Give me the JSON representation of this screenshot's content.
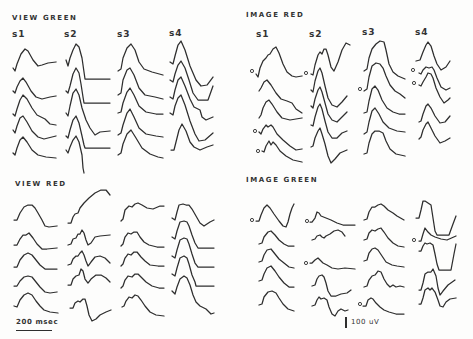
{
  "figure": {
    "panels": [
      {
        "id": "view-green",
        "title": "VIEW GREEN",
        "columns": [
          "s1",
          "s2",
          "s3",
          "s4"
        ]
      },
      {
        "id": "image-red",
        "title": "IMAGE RED",
        "columns": [
          "s1",
          "s2",
          "s3",
          "s4"
        ]
      },
      {
        "id": "view-red",
        "title": "VIEW RED",
        "columns": []
      },
      {
        "id": "image-green",
        "title": "IMAGE GREEN",
        "columns": []
      }
    ],
    "scale_bars": {
      "time": "200 msec",
      "voltage": "100 uV"
    },
    "trace_color": "#2e2e2e",
    "background_color": "#fdfdfc"
  },
  "traces": {
    "view_green": [
      "M13,68 L15,71 L17,64 L21,54 L25,49 L28,51 L33,60 L38,66 L42,65 L48,63 L56,62",
      "M13,91 L15,93 L17,87 L20,81 L23,78 L26,82 L31,91 L36,97 L42,99 L50,97 L56,96",
      "M13,114 L15,116 L17,109 L20,100 L23,95 L27,99 L32,108 L37,115 L41,117 L45,119 L50,124 L56,125",
      "M13,130 L15,133 L17,126 L20,118 L23,116 L27,122 L32,131 L38,137 L44,139 L52,137 L56,136",
      "M13,153 L15,155 L17,148 L20,140 L23,137 L27,142 L32,150 L38,155 L46,157 L56,158",
      "M66,60 L68,66 L70,58 L73,50 L76,44 L79,47 L82,58 L84,72 L85,79 L110,79",
      "M66,91 L68,93 L70,86 L73,74 L76,68 L79,73 L81,84 L83,97 L84,103 L110,103",
      "M66,113 L68,116 L70,106 L73,93 L76,89 L79,95 L82,108 L86,120 L90,128 L95,135 L100,132 L110,131",
      "M66,136 L68,138 L70,130 L73,120 L76,116 L79,123 L82,136 L84,145 L85,148 L110,148",
      "M66,150 L68,153 L70,147 L73,140 L76,136 L79,142 L82,155 L83,168 L84,173",
      "M118,71 L121,69 L123,58 L127,48 L131,44 L135,50 L139,62 L144,69 L152,72 L163,75",
      "M118,95 L121,93 L123,80 L127,70 L130,68 L134,75 L139,88 L145,95 L155,97 L163,99",
      "M118,113 L121,112 L123,103 L127,92 L130,88 L134,95 L139,106 L146,112 L156,114 L163,114",
      "M118,135 L121,133 L123,125 L127,113 L130,109 L134,117 L139,128 L146,134 L156,136 L163,137",
      "M118,155 L121,153 L123,144 L127,134 L131,130 L136,138 L142,148 L150,154 L158,157 L163,158",
      "M170,62 L173,64 L175,56 L178,45 L181,41 L185,50 L190,66 L196,80 L201,86 L207,85 L213,77",
      "M170,80 L173,82 L175,74 L178,65 L181,61 L185,68 L189,80 L193,93 L198,100 L208,100 L213,86",
      "M170,97 L173,99 L175,90 L178,80 L181,77 L185,86 L190,99 L194,107 L198,109 L200,110 L202,117 L206,120 L213,117",
      "M170,113 L173,115 L175,106 L178,98 L181,95 L185,105 L190,121 L195,134 L199,141 L205,140 L213,133",
      "M171,150 L174,150 L176,142 L179,130 L182,124 L186,131 L190,142 L194,147 L200,150 L207,147 L213,145"
    ],
    "image_red": [
      "M256,74 L258,77 L260,68 L263,61 L266,58 L268,55 L270,54 L273,49 L276,47 L279,53 L283,64 L287,72 L292,76 L296,77 L302,76",
      "M259,91 L261,88 L264,82 L267,80 L271,85 L276,93 L281,99 L287,101 L292,103 L296,109 L302,113",
      "M259,118 L261,115 L263,108 L266,102 L269,100 L272,104 L277,112 L282,118 L290,120 L302,118",
      "M259,132 L261,134 L263,129 L266,125 L268,127 L271,125 L273,127 L277,134 L283,140 L290,146 L296,150 L302,149",
      "M262,151 L264,152 L266,146 L269,141 L271,145 L273,142 L276,145 L280,151 L286,156 L293,160 L302,162",
      "M311,74 L313,75 L315,65 L318,55 L320,52 L322,54 L324,49 L326,49 L328,55 L331,67 L334,71 L338,62 L342,50 L346,43 L350,45",
      "M311,90 L313,92 L315,81 L318,71 L320,68 L322,73 L325,86 L328,98 L332,105 L337,107 L342,102 L347,96",
      "M311,106 L313,108 L315,99 L318,90 L320,87 L322,92 L325,103 L328,114 L332,120 L337,122 L342,117 L347,112",
      "M311,125 L313,126 L315,117 L318,107 L320,104 L322,109 L325,121 L328,132 L332,138 L337,138 L342,133 L347,131",
      "M311,147 L313,146 L315,138 L318,131 L320,128 L322,134 L325,144 L328,156 L331,163 L335,159 L340,153 L347,150",
      "M364,71 L367,69 L369,58 L372,49 L376,44 L380,41 L384,42 L386,50 L389,64 L393,72 L398,76 L405,79",
      "M364,91 L367,89 L369,77 L372,66 L376,63 L380,64 L383,68 L386,76 L390,85 L395,91 L400,94 L405,98",
      "M364,113 L367,112 L369,101 L372,89 L375,86 L378,90 L382,100 L387,108 L393,112 L399,114 L405,114",
      "M364,134 L367,132 L369,122 L372,111 L375,108 L379,114 L383,122 L389,128 L397,131 L405,132",
      "M364,154 L367,153 L369,143 L372,134 L375,131 L379,131 L383,133 L386,141 L390,149 L396,154 L405,156",
      "M416,61 L420,60 L423,52 L426,45 L428,42 L431,46 L434,56 L437,64 L441,70 L446,67 L450,61",
      "M419,73 L421,74 L423,70 L426,67 L429,68 L432,67 L434,70 L437,78 L441,87 L446,90 L450,88",
      "M419,85 L421,86 L423,82 L426,77 L428,73 L431,74 L433,78 L436,88 L440,97 L444,103 L448,100 L450,98",
      "M419,122 L421,121 L423,114 L426,106 L428,104 L431,108 L435,116 L440,123 L445,122 L450,116",
      "M419,139 L421,137 L423,130 L426,124 L428,122 L431,128 L435,136 L440,143 L445,141 L450,138"
    ],
    "view_red": [
      "M14,220 L17,220 L20,213 L24,207 L28,205 L32,205 L35,208 L38,213 L42,220 L45,226 L49,227 L57,226",
      "M14,245 L17,245 L20,239 L23,235 L26,235 L29,233 L33,238 L37,244 L42,249 L47,249 L57,248",
      "M14,267 L17,267 L20,260 L24,255 L28,253 L32,255 L36,260 L40,265 L45,269 L57,269",
      "M14,286 L17,286 L20,281 L24,277 L28,276 L32,277 L36,282 L40,287 L45,292 L50,293 L57,292",
      "M14,306 L17,307 L20,300 L24,295 L28,293 L32,295 L36,301 L40,306 L44,310 L50,312 L58,313",
      "M68,223 L71,223 L73,217 L75,214 L78,213 L80,208 L84,203 L89,198 L95,193 L101,190 L106,190 L110,195",
      "M68,245 L71,244 L73,239 L76,238 L78,234 L80,234 L82,230 L84,233 L86,240 L88,245 L91,243 L95,237 L100,236 L110,235",
      "M68,265 L71,264 L73,259 L76,256 L78,256 L80,253 L82,251 L84,255 L86,261 L88,266 L91,262 L95,257 L100,256 L105,258 L110,263",
      "M68,285 L71,285 L73,279 L76,276 L79,275 L81,269 L83,271 L85,279 L88,283 L91,279 L96,275 L101,275 L106,278 L110,282",
      "M70,308 L73,308 L75,303 L78,301 L80,302 L83,299 L85,299 L87,306 L89,315 L92,321 L96,319 L100,315 L106,312 L111,310",
      "M121,221 L123,219 L125,210 L129,206 L132,207 L135,204 L138,203 L142,205 L147,208 L153,209 L160,206 L164,206",
      "M121,246 L123,244 L125,237 L128,233 L131,234 L134,232 L137,232 L140,237 L144,242 L149,245 L157,247 L164,247",
      "M121,266 L123,264 L125,258 L128,254 L131,255 L134,252 L137,252 L141,257 L145,261 L150,265 L158,266 L164,266",
      "M121,288 L123,286 L125,280 L128,276 L132,277 L135,274 L138,274 L142,278 L146,282 L152,286 L159,288 L164,288",
      "M122,307 L124,306 L126,301 L129,297 L132,298 L135,295 L138,296 L141,300 L145,306 L150,312 L156,315 L164,316",
      "M172,218 L175,220 L177,212 L179,205 L183,204 L186,205 L189,205 L192,209 L196,216 L200,223 L204,226 L210,222 L214,220",
      "M172,237 L175,239 L177,231 L180,222 L184,221 L187,222 L189,226 L192,235 L195,243 L198,248 L214,248",
      "M172,256 L175,258 L177,250 L180,240 L184,238 L187,239 L189,244 L192,254 L195,263 L198,267 L214,267",
      "M172,274 L175,276 L177,268 L180,258 L184,256 L187,258 L189,264 L192,275 L195,282 L196,286 L214,286",
      "M172,291 L175,294 L177,287 L180,279 L184,276 L187,278 L190,285 L193,295 L196,302 L200,306 L206,309 L211,314 L214,313"
    ],
    "image_green": [
      "M256,221 L259,221 L261,215 L264,208 L267,205 L270,208 L274,214 L279,221 L283,226 L286,227 L288,222 L290,214 L292,208 L294,204",
      "M259,244 L262,243 L264,237 L268,232 L271,231 L275,235 L279,240 L284,244 L288,246 L294,246",
      "M259,262 L262,261 L264,255 L267,250 L271,249 L275,254 L279,259 L284,263 L289,267 L294,268",
      "M259,281 L262,280 L264,274 L267,268 L271,266 L275,271 L279,277 L284,283 L289,287 L294,287",
      "M259,305 L262,304 L264,297 L268,292 L272,291 L276,293 L279,298 L283,304 L288,309 L294,311",
      "M310,222 L312,222 L315,218 L317,212 L319,213 L321,216 L326,218 L331,220 L337,223 L343,225 L355,225",
      "M312,240 L315,239 L317,236 L320,235 L322,237 L324,238 L326,236 L330,234 L334,231 L338,230 L342,232 L345,236",
      "M310,263 L312,263 L315,260 L318,258 L320,260 L323,263 L327,265 L332,268 L338,269 L345,268 L355,269",
      "M312,286 L315,285 L317,279 L319,276 L322,275 L324,277 L326,283 L328,291 L331,296 L336,296 L341,294 L347,293 L351,290",
      "M312,306 L315,305 L317,300 L319,297 L321,299 L324,298 L327,300 L329,307 L332,314 L335,316 L338,311 L341,309 L345,311 L348,310",
      "M364,220 L367,219 L369,212 L372,207 L375,207 L378,205 L381,204 L384,206 L388,210 L393,213 L397,216 L404,220",
      "M364,240 L367,239 L369,233 L372,230 L375,231 L378,229 L381,228 L384,232 L388,238 L393,243 L398,246 L404,247",
      "M364,261 L367,260 L369,253 L372,249 L375,248 L378,250 L382,256 L386,262 L392,265 L397,266 L404,267",
      "M364,287 L367,286 L369,280 L372,276 L375,275 L378,271 L381,272 L384,279 L387,284 L390,287 L393,285 L396,287 L400,286 L404,287",
      "M363,306 L366,306 L368,300 L371,298 L373,299 L376,303 L380,307 L384,310 L389,312 L396,314 L404,314",
      "M416,218 L419,218 L421,210 L423,201 L425,201 L428,203 L431,205 L433,218 L435,231 L437,235 L449,235 L453,224 L456,216",
      "M419,241 L421,241 L423,234 L425,228 L428,232 L431,235 L435,237 L441,239 L447,240 L456,236",
      "M419,251 L421,251 L423,246 L425,243 L427,244 L430,243 L433,245 L435,254 L437,264 L439,270 L451,270 L454,254 L456,244",
      "M419,290 L421,290 L423,283 L425,274 L428,272 L431,272 L433,269 L436,276 L438,288 L440,295 L443,291 L448,285 L455,280",
      "M419,304 L421,304 L423,298 L425,290 L428,288 L430,290 L432,288 L435,292 L438,300 L440,306 L443,307 L446,302 L450,299 L456,298"
    ],
    "stimulus_markers": [
      [
        252,
        71
      ],
      [
        306,
        73
      ],
      [
        255,
        131
      ],
      [
        258,
        151
      ],
      [
        360,
        89
      ],
      [
        413,
        70
      ],
      [
        414,
        83
      ],
      [
        252,
        220
      ],
      [
        307,
        221
      ],
      [
        306,
        263
      ],
      [
        360,
        304
      ],
      [
        414,
        240
      ]
    ]
  }
}
